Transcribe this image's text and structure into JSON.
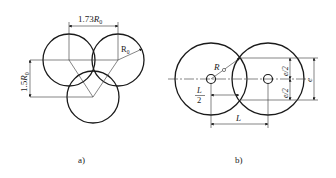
{
  "figure_a": {
    "caption": "a)",
    "dim_horizontal": "1.73",
    "dim_horizontal_var": "R",
    "dim_horizontal_sub": "0",
    "dim_vertical": "1.5",
    "dim_vertical_var": "R",
    "dim_vertical_sub": "0",
    "radius_label": "R",
    "radius_sub": "0"
  },
  "figure_b": {
    "caption": "b)",
    "radius_label": "R",
    "half_L_num": "L",
    "half_L_den": "2",
    "dim_L": "L",
    "dim_e": "e",
    "dim_e_half_top": "e/2",
    "dim_e_half_bottom": "e/2"
  },
  "colors": {
    "line": "#1a1a1a",
    "thin": "#333333",
    "background": "#ffffff"
  }
}
